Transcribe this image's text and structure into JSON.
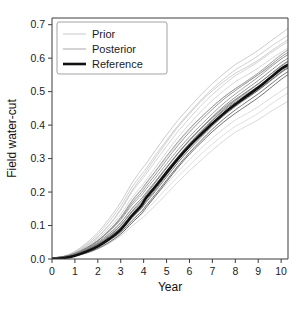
{
  "chart_data": {
    "type": "line",
    "title": "",
    "xlabel": "Year",
    "ylabel": "Field water-cut",
    "xlim": [
      0,
      10.3
    ],
    "ylim": [
      0.0,
      0.72
    ],
    "grid": false,
    "legend_position": "top-left",
    "x_ticks": [
      "0",
      "1",
      "2",
      "3",
      "4",
      "5",
      "6",
      "7",
      "8",
      "9",
      "10"
    ],
    "x_tick_values": [
      0,
      1,
      2,
      3,
      4,
      5,
      6,
      7,
      8,
      9,
      10
    ],
    "y_ticks": [
      "0.0",
      "0.1",
      "0.2",
      "0.3",
      "0.4",
      "0.5",
      "0.6",
      "0.7"
    ],
    "y_tick_values": [
      0.0,
      0.1,
      0.2,
      0.3,
      0.4,
      0.5,
      0.6,
      0.7
    ],
    "legend": [
      {
        "label": "Prior",
        "color": "#c8c8c8",
        "width": 1.0
      },
      {
        "label": "Posterior",
        "color": "#a8a8a8",
        "width": 1.0
      },
      {
        "label": "Reference",
        "color": "#111111",
        "width": 2.6
      }
    ],
    "x": [
      0,
      0.5,
      1,
      1.5,
      2,
      2.5,
      3,
      3.5,
      3.9,
      4.1,
      4.5,
      5,
      5.5,
      6,
      6.5,
      7,
      7.5,
      8,
      8.2,
      8.4,
      9,
      9.5,
      10,
      10.3
    ],
    "series": [
      {
        "name": "Reference",
        "group": "reference",
        "color": "#111111",
        "width": 2.6,
        "values": [
          0.0,
          0.003,
          0.01,
          0.022,
          0.038,
          0.06,
          0.088,
          0.13,
          0.16,
          0.182,
          0.215,
          0.258,
          0.3,
          0.338,
          0.372,
          0.405,
          0.435,
          0.462,
          0.472,
          0.482,
          0.512,
          0.54,
          0.568,
          0.58
        ]
      },
      {
        "name": "Prior 1",
        "group": "prior",
        "color": "#bfbfbf",
        "width": 0.9,
        "values": [
          0.0,
          0.006,
          0.02,
          0.044,
          0.076,
          0.118,
          0.168,
          0.228,
          0.268,
          0.286,
          0.326,
          0.374,
          0.418,
          0.456,
          0.492,
          0.524,
          0.552,
          0.578,
          0.586,
          0.594,
          0.62,
          0.646,
          0.672,
          0.688
        ]
      },
      {
        "name": "Prior 2",
        "group": "prior",
        "color": "#c4c4c4",
        "width": 0.9,
        "values": [
          0.0,
          0.005,
          0.018,
          0.04,
          0.07,
          0.11,
          0.158,
          0.216,
          0.254,
          0.272,
          0.312,
          0.358,
          0.402,
          0.44,
          0.476,
          0.508,
          0.536,
          0.562,
          0.57,
          0.578,
          0.604,
          0.63,
          0.654,
          0.668
        ]
      },
      {
        "name": "Prior 3",
        "group": "prior",
        "color": "#c9c9c9",
        "width": 0.9,
        "values": [
          0.0,
          0.005,
          0.016,
          0.036,
          0.064,
          0.1,
          0.146,
          0.202,
          0.238,
          0.256,
          0.294,
          0.34,
          0.384,
          0.422,
          0.458,
          0.49,
          0.518,
          0.544,
          0.552,
          0.56,
          0.586,
          0.612,
          0.636,
          0.65
        ]
      },
      {
        "name": "Prior 4",
        "group": "prior",
        "color": "#cccccc",
        "width": 0.9,
        "values": [
          0.0,
          0.004,
          0.014,
          0.032,
          0.058,
          0.092,
          0.134,
          0.186,
          0.22,
          0.238,
          0.276,
          0.322,
          0.366,
          0.404,
          0.44,
          0.472,
          0.5,
          0.526,
          0.534,
          0.542,
          0.568,
          0.594,
          0.618,
          0.632
        ]
      },
      {
        "name": "Prior 5",
        "group": "prior",
        "color": "#d0d0d0",
        "width": 0.9,
        "values": [
          0.0,
          0.004,
          0.013,
          0.03,
          0.054,
          0.086,
          0.126,
          0.176,
          0.208,
          0.226,
          0.262,
          0.306,
          0.348,
          0.386,
          0.42,
          0.452,
          0.48,
          0.506,
          0.514,
          0.522,
          0.548,
          0.574,
          0.598,
          0.612
        ]
      },
      {
        "name": "Prior 6",
        "group": "prior",
        "color": "#c6c6c6",
        "width": 0.9,
        "values": [
          0.0,
          0.003,
          0.011,
          0.026,
          0.046,
          0.074,
          0.11,
          0.154,
          0.184,
          0.2,
          0.234,
          0.276,
          0.316,
          0.352,
          0.386,
          0.418,
          0.446,
          0.472,
          0.48,
          0.488,
          0.514,
          0.54,
          0.564,
          0.578
        ]
      },
      {
        "name": "Prior 7",
        "group": "prior",
        "color": "#d3d3d3",
        "width": 0.9,
        "values": [
          0.0,
          0.003,
          0.009,
          0.02,
          0.036,
          0.058,
          0.086,
          0.122,
          0.146,
          0.16,
          0.19,
          0.226,
          0.262,
          0.296,
          0.328,
          0.358,
          0.386,
          0.412,
          0.42,
          0.428,
          0.454,
          0.48,
          0.504,
          0.518
        ]
      },
      {
        "name": "Prior 8",
        "group": "prior",
        "color": "#cfcfcf",
        "width": 0.9,
        "values": [
          0.0,
          0.002,
          0.007,
          0.016,
          0.03,
          0.048,
          0.072,
          0.102,
          0.124,
          0.136,
          0.162,
          0.196,
          0.23,
          0.262,
          0.292,
          0.322,
          0.35,
          0.376,
          0.384,
          0.392,
          0.416,
          0.44,
          0.462,
          0.474
        ]
      },
      {
        "name": "Prior 9",
        "group": "prior",
        "color": "#d6d6d6",
        "width": 0.9,
        "values": [
          0.0,
          0.002,
          0.008,
          0.018,
          0.033,
          0.053,
          0.08,
          0.113,
          0.136,
          0.148,
          0.176,
          0.212,
          0.246,
          0.278,
          0.31,
          0.34,
          0.368,
          0.394,
          0.402,
          0.41,
          0.436,
          0.462,
          0.486,
          0.5
        ]
      },
      {
        "name": "Prior 10",
        "group": "prior",
        "color": "#c2c2c2",
        "width": 0.9,
        "values": [
          0.0,
          0.005,
          0.017,
          0.038,
          0.067,
          0.105,
          0.152,
          0.209,
          0.246,
          0.264,
          0.303,
          0.349,
          0.393,
          0.431,
          0.467,
          0.499,
          0.527,
          0.553,
          0.561,
          0.569,
          0.595,
          0.621,
          0.645,
          0.659
        ]
      },
      {
        "name": "Posterior 1",
        "group": "posterior",
        "color": "#8c8c8c",
        "width": 0.9,
        "values": [
          0.0,
          0.004,
          0.013,
          0.029,
          0.051,
          0.08,
          0.116,
          0.162,
          0.192,
          0.21,
          0.244,
          0.288,
          0.33,
          0.368,
          0.402,
          0.434,
          0.464,
          0.49,
          0.5,
          0.51,
          0.54,
          0.568,
          0.596,
          0.61
        ]
      },
      {
        "name": "Posterior 2",
        "group": "posterior",
        "color": "#7a7a7a",
        "width": 0.9,
        "values": [
          0.0,
          0.004,
          0.012,
          0.027,
          0.047,
          0.074,
          0.108,
          0.152,
          0.182,
          0.2,
          0.234,
          0.278,
          0.32,
          0.358,
          0.392,
          0.424,
          0.454,
          0.48,
          0.49,
          0.5,
          0.53,
          0.558,
          0.586,
          0.6
        ]
      },
      {
        "name": "Posterior 3",
        "group": "posterior",
        "color": "#6e6e6e",
        "width": 0.9,
        "values": [
          0.0,
          0.003,
          0.011,
          0.025,
          0.044,
          0.069,
          0.101,
          0.143,
          0.172,
          0.19,
          0.224,
          0.267,
          0.309,
          0.347,
          0.381,
          0.414,
          0.444,
          0.47,
          0.48,
          0.49,
          0.52,
          0.548,
          0.576,
          0.59
        ]
      },
      {
        "name": "Posterior 4",
        "group": "posterior",
        "color": "#636363",
        "width": 0.9,
        "values": [
          0.0,
          0.003,
          0.01,
          0.023,
          0.041,
          0.064,
          0.094,
          0.134,
          0.163,
          0.182,
          0.215,
          0.258,
          0.3,
          0.338,
          0.372,
          0.405,
          0.435,
          0.462,
          0.472,
          0.482,
          0.512,
          0.54,
          0.568,
          0.582
        ]
      },
      {
        "name": "Posterior 5",
        "group": "posterior",
        "color": "#5a5a5a",
        "width": 0.9,
        "values": [
          0.0,
          0.003,
          0.009,
          0.021,
          0.038,
          0.06,
          0.088,
          0.126,
          0.154,
          0.172,
          0.205,
          0.248,
          0.29,
          0.328,
          0.362,
          0.395,
          0.425,
          0.452,
          0.462,
          0.472,
          0.502,
          0.53,
          0.558,
          0.572
        ]
      },
      {
        "name": "Posterior 6",
        "group": "posterior",
        "color": "#555555",
        "width": 0.9,
        "values": [
          0.0,
          0.002,
          0.008,
          0.019,
          0.035,
          0.056,
          0.082,
          0.118,
          0.145,
          0.163,
          0.196,
          0.238,
          0.28,
          0.318,
          0.352,
          0.385,
          0.415,
          0.442,
          0.452,
          0.462,
          0.492,
          0.52,
          0.548,
          0.562
        ]
      },
      {
        "name": "Posterior 7",
        "group": "posterior",
        "color": "#808080",
        "width": 0.9,
        "values": [
          0.0,
          0.004,
          0.014,
          0.031,
          0.054,
          0.085,
          0.123,
          0.171,
          0.202,
          0.22,
          0.254,
          0.298,
          0.34,
          0.378,
          0.412,
          0.444,
          0.474,
          0.5,
          0.51,
          0.52,
          0.55,
          0.578,
          0.606,
          0.62
        ]
      },
      {
        "name": "Posterior 8",
        "group": "posterior",
        "color": "#6a6a6a",
        "width": 0.9,
        "values": [
          0.0,
          0.003,
          0.01,
          0.024,
          0.043,
          0.067,
          0.098,
          0.139,
          0.168,
          0.186,
          0.22,
          0.263,
          0.305,
          0.343,
          0.377,
          0.41,
          0.44,
          0.466,
          0.476,
          0.486,
          0.516,
          0.544,
          0.572,
          0.586
        ]
      },
      {
        "name": "Posterior 9",
        "group": "posterior",
        "color": "#5f5f5f",
        "width": 0.9,
        "values": [
          0.0,
          0.003,
          0.009,
          0.022,
          0.039,
          0.062,
          0.091,
          0.13,
          0.158,
          0.176,
          0.209,
          0.252,
          0.294,
          0.332,
          0.366,
          0.399,
          0.429,
          0.456,
          0.466,
          0.476,
          0.506,
          0.534,
          0.562,
          0.576
        ]
      },
      {
        "name": "Posterior 10",
        "group": "posterior",
        "color": "#747474",
        "width": 0.9,
        "values": [
          0.0,
          0.003,
          0.011,
          0.026,
          0.045,
          0.071,
          0.104,
          0.147,
          0.177,
          0.195,
          0.229,
          0.272,
          0.314,
          0.352,
          0.386,
          0.419,
          0.449,
          0.475,
          0.485,
          0.495,
          0.525,
          0.553,
          0.581,
          0.595
        ]
      },
      {
        "name": "Posterior 11",
        "group": "posterior",
        "color": "#4e4e4e",
        "width": 0.9,
        "values": [
          0.0,
          0.002,
          0.008,
          0.018,
          0.033,
          0.053,
          0.078,
          0.112,
          0.138,
          0.155,
          0.188,
          0.23,
          0.272,
          0.31,
          0.344,
          0.377,
          0.407,
          0.434,
          0.444,
          0.454,
          0.484,
          0.512,
          0.54,
          0.554
        ]
      },
      {
        "name": "Posterior 12",
        "group": "posterior",
        "color": "#888888",
        "width": 0.9,
        "values": [
          0.0,
          0.004,
          0.015,
          0.033,
          0.057,
          0.089,
          0.128,
          0.178,
          0.21,
          0.228,
          0.262,
          0.306,
          0.348,
          0.386,
          0.42,
          0.452,
          0.482,
          0.508,
          0.518,
          0.528,
          0.558,
          0.586,
          0.614,
          0.628
        ]
      }
    ]
  }
}
